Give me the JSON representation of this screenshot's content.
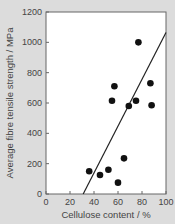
{
  "chart_data": {
    "type": "scatter",
    "title": "",
    "xlabel": "Cellulose content / %",
    "ylabel": "Average fibre tensile strength / MPa",
    "xlim": [
      0,
      100
    ],
    "ylim": [
      0,
      1200
    ],
    "xticks": [
      0,
      20,
      40,
      60,
      80,
      100
    ],
    "yticks": [
      0,
      200,
      400,
      600,
      800,
      1000,
      1200
    ],
    "grid": false,
    "legend": null,
    "series": [
      {
        "name": "fibres",
        "marker": "filled-circle",
        "color": "#111111",
        "points": [
          {
            "x": 36,
            "y": 150
          },
          {
            "x": 45,
            "y": 125
          },
          {
            "x": 52,
            "y": 160
          },
          {
            "x": 60,
            "y": 75
          },
          {
            "x": 65,
            "y": 235
          },
          {
            "x": 55,
            "y": 615
          },
          {
            "x": 57,
            "y": 710
          },
          {
            "x": 69,
            "y": 580
          },
          {
            "x": 75,
            "y": 615
          },
          {
            "x": 77,
            "y": 1000
          },
          {
            "x": 87,
            "y": 730
          },
          {
            "x": 88,
            "y": 585
          }
        ]
      }
    ],
    "trendline": {
      "type": "linear",
      "start": {
        "x": 31,
        "y": 0
      },
      "end": {
        "x": 100,
        "y": 1065
      },
      "color": "#222222"
    }
  }
}
